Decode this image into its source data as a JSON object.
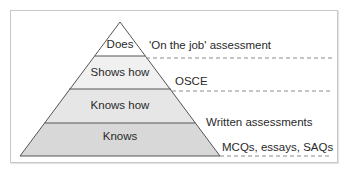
{
  "diagram": {
    "type": "pyramid",
    "layers": [
      {
        "label": "Does",
        "assessment": "'On the job' assessment",
        "fill": "#ffffff"
      },
      {
        "label": "Shows how",
        "assessment": "OSCE",
        "fill": "#f0f0f0"
      },
      {
        "label": "Knows how",
        "assessment": "Written assessments",
        "fill": "#e6e6e6"
      },
      {
        "label": "Knows",
        "assessment": "MCQs, essays, SAQs",
        "fill": "#d8d8d8"
      }
    ],
    "colors": {
      "outline": "#555555",
      "dashed_line": "#888888",
      "frame_border": "#c8c8c8"
    }
  }
}
